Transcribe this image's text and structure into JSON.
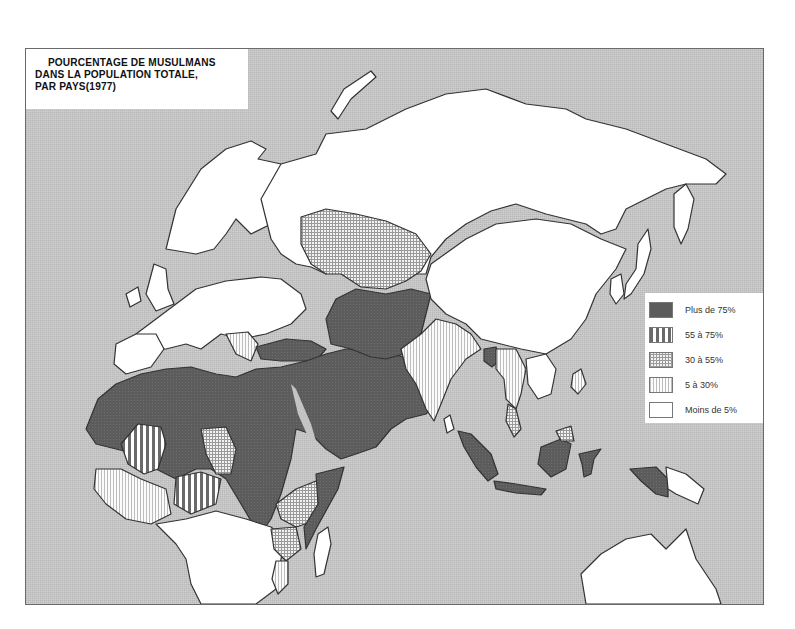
{
  "map": {
    "title_lines": [
      "POURCENTAGE DE MUSULMANS",
      "DANS LA POPULATION TOTALE,",
      "PAR PAYS(1977)"
    ],
    "colors": {
      "ocean": "#c4c4c4",
      "plus_75": "#5e5e5e",
      "55_75": "#8a8a8a",
      "30_55": "#c9c9c9",
      "5_30": "#e6e6e6",
      "moins_5": "#ffffff",
      "border": "#333333"
    },
    "legend": [
      {
        "label": "Plus de 75%",
        "pattern": "solid-dark"
      },
      {
        "label": "55 à 75%",
        "pattern": "vertical-stripes"
      },
      {
        "label": "30 à 55%",
        "pattern": "crosshatch"
      },
      {
        "label": "5 à 30%",
        "pattern": "fine-vertical-lines"
      },
      {
        "label": "Moins de 5%",
        "pattern": "blank"
      }
    ]
  }
}
